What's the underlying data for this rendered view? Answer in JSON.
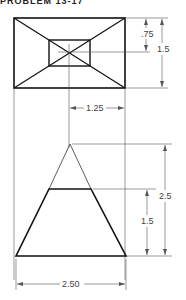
{
  "header": {
    "text": "PROBLEM 13-17"
  },
  "top_view": {
    "outer_rect": "base rectangle",
    "inner_rect": "top rectangle",
    "dimensions": {
      "inner_offset": ".75",
      "height": "1.5",
      "horizontal": "1.25"
    }
  },
  "front_view": {
    "dimensions": {
      "total_height": "2.5",
      "frustum_height": "1.5",
      "base_width": "2.50"
    }
  },
  "colors": {
    "line": "#111111",
    "dim_line": "#555555",
    "text": "#444444"
  }
}
